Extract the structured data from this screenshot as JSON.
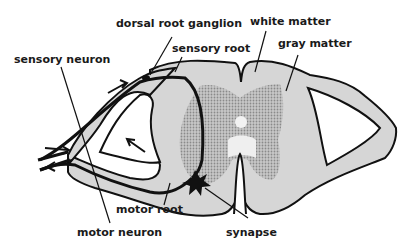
{
  "diagram": {
    "labels": {
      "dorsal_root_ganglion": "dorsal root ganglion",
      "sensory_root": "sensory root",
      "white_matter": "white matter",
      "gray_matter": "gray matter",
      "sensory_neuron": "sensory neuron",
      "motor_root": "motor root",
      "motor_neuron": "motor neuron",
      "synapse": "synapse"
    },
    "colors": {
      "white_matter": "#d9d9d9",
      "gray_matter": "#b3b3b3",
      "outline": "#111111",
      "background": "#ffffff"
    }
  }
}
